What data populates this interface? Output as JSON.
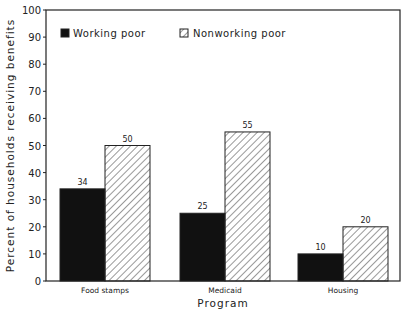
{
  "chart_data": {
    "type": "bar",
    "title": "",
    "xlabel": "Program",
    "ylabel": "Percent of households receiving benefits",
    "categories": [
      "Food stamps",
      "Medicaid",
      "Housing"
    ],
    "series": [
      {
        "name": "Working poor",
        "values": [
          34,
          25,
          10
        ],
        "fill": "solid",
        "color": "#111111"
      },
      {
        "name": "Nonworking poor",
        "values": [
          50,
          55,
          20
        ],
        "fill": "hatched",
        "color": "#ffffff"
      }
    ],
    "ylim": [
      0,
      100
    ],
    "yticks": [
      0,
      10,
      20,
      30,
      40,
      50,
      60,
      70,
      80,
      90,
      100
    ],
    "grid": false,
    "legend_position": "top-left inside"
  }
}
